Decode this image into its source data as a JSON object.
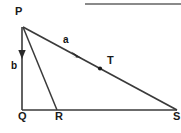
{
  "figure": {
    "kind": "geometry-diagram",
    "background_color": "#ffffff",
    "stroke_color": "#333333",
    "label_color": "#1a1a1a",
    "top_rule_color": "#8a8a8a",
    "vertices": {
      "P": {
        "label": "P",
        "x": 22,
        "y": 26
      },
      "Q": {
        "label": "Q",
        "x": 22,
        "y": 110
      },
      "R": {
        "label": "R",
        "x": 57,
        "y": 110
      },
      "S": {
        "label": "S",
        "x": 177,
        "y": 110
      },
      "T": {
        "label": "T",
        "x": 100,
        "y": 69
      }
    },
    "vectors": {
      "a": {
        "label": "a",
        "from": "P",
        "to": "S",
        "arrow_at_x": 78,
        "arrow_at_y": 55
      },
      "b": {
        "label": "b",
        "from": "P",
        "to": "Q",
        "arrow_at_x": 22,
        "arrow_at_y": 58
      }
    },
    "segments": [
      {
        "name": "PQ",
        "from": "P",
        "to": "Q"
      },
      {
        "name": "PR",
        "from": "P",
        "to": "R"
      },
      {
        "name": "PS",
        "from": "P",
        "to": "S"
      },
      {
        "name": "QS",
        "from": "Q",
        "to": "S"
      }
    ]
  }
}
